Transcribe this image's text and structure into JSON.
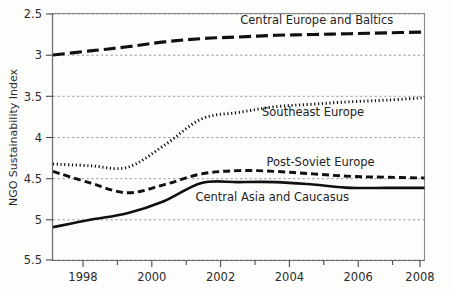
{
  "chart_data": {
    "type": "line",
    "title": "",
    "subtitle": "",
    "xlabel": "",
    "ylabel": "NGO Sustainability Index",
    "xlim": [
      1998,
      2008
    ],
    "ylim": [
      2.5,
      5.5
    ],
    "y_axis_inverted": true,
    "grid": "horizontal dashed gridlines at each major y tick",
    "legend": "inline series labels placed next to each curve (no legend box)",
    "x_ticks": [
      1998,
      2000,
      2002,
      2004,
      2006,
      2008
    ],
    "x_tick_labels": [
      "1998",
      "2000",
      "2002",
      "2004",
      "2006",
      "2008"
    ],
    "x_minor_ticks": [
      1999,
      2001,
      2003,
      2005,
      2007
    ],
    "y_ticks": [
      2.5,
      3,
      3.5,
      4,
      4.5,
      5,
      5.5
    ],
    "y_tick_labels": [
      "2.5",
      "3",
      "3.5",
      "4",
      "4.5",
      "5",
      "5.5"
    ],
    "x": [
      1998,
      1999,
      2000,
      2001,
      2002,
      2003,
      2004,
      2005,
      2006,
      2007,
      2008
    ],
    "series": [
      {
        "name": "Central Europe and Baltics",
        "style": "long-dash",
        "color": "#101010",
        "values": [
          3.0,
          2.95,
          2.9,
          2.84,
          2.8,
          2.78,
          2.76,
          2.75,
          2.74,
          2.73,
          2.72
        ]
      },
      {
        "name": "Southeast Europe",
        "style": "dotted",
        "color": "#101010",
        "values": [
          4.33,
          4.35,
          4.37,
          4.1,
          3.78,
          3.7,
          3.63,
          3.6,
          3.57,
          3.55,
          3.52
        ]
      },
      {
        "name": "Post-Soviet Europe",
        "style": "dashed",
        "color": "#101010",
        "values": [
          4.42,
          4.56,
          4.68,
          4.58,
          4.45,
          4.41,
          4.42,
          4.45,
          4.48,
          4.49,
          4.5
        ]
      },
      {
        "name": "Central Asia and Caucasus",
        "style": "solid",
        "color": "#101010",
        "values": [
          5.1,
          5.01,
          4.93,
          4.78,
          4.56,
          4.55,
          4.55,
          4.58,
          4.62,
          4.62,
          4.62
        ]
      }
    ],
    "annotations": [
      {
        "text": "Central Europe and Baltics",
        "series": "Central Europe and Baltics",
        "x": 2005.1,
        "y": 2.62
      },
      {
        "text": "Southeast Europe",
        "series": "Southeast Europe",
        "x": 2005.0,
        "y": 3.74
      },
      {
        "text": "Post-Soviet Europe",
        "series": "Post-Soviet Europe",
        "x": 2005.2,
        "y": 4.35
      },
      {
        "text": "Central Asia and Caucasus",
        "series": "Central Asia and Caucasus",
        "x": 2003.9,
        "y": 4.78
      }
    ]
  }
}
